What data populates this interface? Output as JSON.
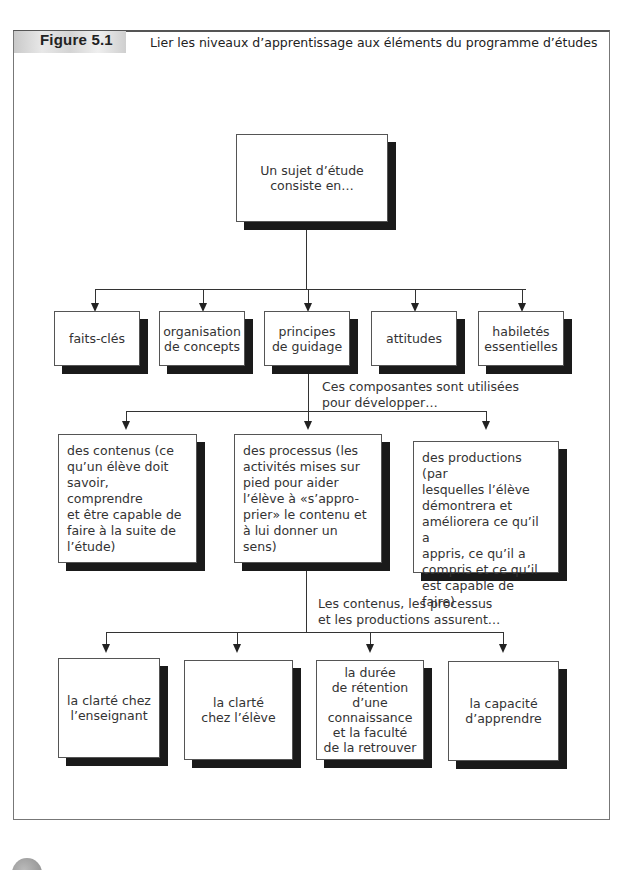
{
  "header": {
    "figure_label": "Figure 5.1",
    "title": "Lier les niveaux d’apprentissage aux éléments du programme d’études"
  },
  "root": {
    "label": "Un sujet d’étude\nconsiste en…"
  },
  "components": [
    {
      "label": "faits-clés"
    },
    {
      "label": "organisation\nde concepts"
    },
    {
      "label": "principes\nde guidage"
    },
    {
      "label": "attitudes"
    },
    {
      "label": "habiletés\nessentielles"
    }
  ],
  "connector_1": {
    "label": "Ces composantes sont utilisées\npour développer…"
  },
  "developments": [
    {
      "label": "des contenus (ce\nqu’un élève doit\nsavoir, comprendre\net être capable de\nfaire à la suite de\nl’étude)"
    },
    {
      "label": "des processus (les\nactivités mises sur\npied pour aider\nl’élève à «s’appro-\nprier» le contenu et\nà lui donner un sens)"
    },
    {
      "label": "des productions (par\nlesquelles l’élève\ndémontrera et\naméliorera ce qu’il a\nappris, ce qu’il a\ncompris et ce qu’il\nest capable de faire)"
    }
  ],
  "connector_2": {
    "label": "Les contenus, les processus\net les productions assurent…"
  },
  "outcomes": [
    {
      "label": "la clarté chez\nl’enseignant"
    },
    {
      "label": "la clarté\nchez l’élève"
    },
    {
      "label": "la durée\nde rétention\nd’une\nconnaissance\net la faculté\nde la retrouver"
    },
    {
      "label": "la capacité\nd’apprendre"
    }
  ]
}
